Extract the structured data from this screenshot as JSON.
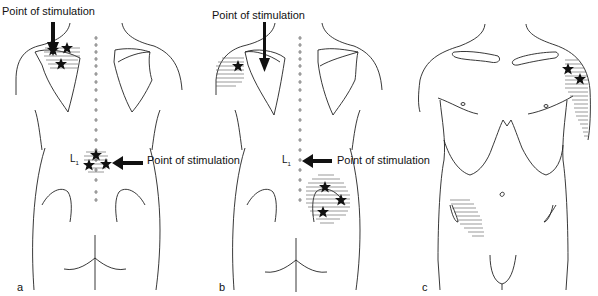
{
  "figure": {
    "panels": [
      {
        "id": "a",
        "letter": "a",
        "view": "posterior",
        "labels": {
          "top_stimulation": "Point of stimulation",
          "lower_stimulation": "Point of stimulation",
          "vertebra": "L",
          "vertebra_sub": "1"
        },
        "stars": 6
      },
      {
        "id": "b",
        "letter": "b",
        "view": "posterior",
        "labels": {
          "top_stimulation": "Point of stimulation",
          "lower_stimulation": "Point of stimulation",
          "vertebra": "L",
          "vertebra_sub": "1"
        },
        "stars": 4
      },
      {
        "id": "c",
        "letter": "c",
        "view": "anterior",
        "stars": 2
      }
    ],
    "colors": {
      "line": "#222222",
      "hatch": "#555555",
      "star": "#111111",
      "background": "#ffffff"
    }
  }
}
